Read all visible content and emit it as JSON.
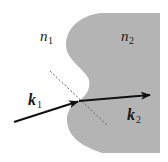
{
  "diagram": {
    "type": "refraction-interface",
    "colors": {
      "background": "#ffffff",
      "medium2_fill": "#b4b4b4",
      "arrow": "#111111",
      "normal_line": "#6a6a6a",
      "text": "#1a1a1a"
    },
    "media": [
      {
        "id": "medium-1",
        "symbol": "n",
        "subscript": "1"
      },
      {
        "id": "medium-2",
        "symbol": "n",
        "subscript": "2"
      }
    ],
    "wave_vectors": [
      {
        "id": "incident",
        "symbol": "k",
        "subscript": "1"
      },
      {
        "id": "refracted",
        "symbol": "k",
        "subscript": "2"
      }
    ],
    "normal": {
      "style": "dashed"
    }
  }
}
